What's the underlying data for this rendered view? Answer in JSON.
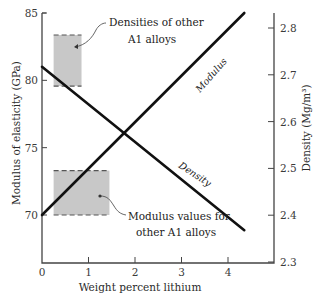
{
  "chart_data": {
    "type": "line",
    "title": "",
    "xlabel": "Weight percent lithium",
    "ylabel_left": "Modulus of elasticity (GPa)",
    "ylabel_right": "Density (Mg/m³)",
    "xlim": [
      0,
      5
    ],
    "ylim_left": [
      67.5,
      85
    ],
    "ylim_right": [
      2.3,
      2.83
    ],
    "x_ticks": [
      0,
      1,
      2,
      3,
      4
    ],
    "x_tick_labels": [
      "0",
      "1",
      "2",
      "3",
      "4"
    ],
    "y_left_ticks": [
      70,
      75,
      80,
      85
    ],
    "y_left_tick_labels": [
      "70",
      "75",
      "80",
      "85"
    ],
    "y_right_ticks": [
      2.3,
      2.4,
      2.5,
      2.6,
      2.7,
      2.8
    ],
    "y_right_tick_labels": [
      "2.3",
      "2.4",
      "2.5",
      "2.6",
      "2.7",
      "2.8"
    ],
    "grid": false,
    "series": [
      {
        "name": "Modulus",
        "axis": "left",
        "x": [
          0,
          4.35
        ],
        "y": [
          70,
          85
        ]
      },
      {
        "name": "Density",
        "axis": "right",
        "x": [
          0,
          4.35
        ],
        "y": [
          2.717,
          2.368
        ]
      }
    ],
    "shaded_regions": [
      {
        "label": "Densities of other Al alloys",
        "label_lines": [
          "Densities of other",
          "A1 alloys"
        ],
        "axis": "right",
        "x_range": [
          0.25,
          0.85
        ],
        "y_range": [
          2.676,
          2.785
        ]
      },
      {
        "label": "Modulus values for other Al alloys",
        "label_lines": [
          "Modulus values for",
          "other A1 alloys"
        ],
        "axis": "left",
        "x_range": [
          0.25,
          1.45
        ],
        "y_range": [
          70,
          73.3
        ]
      }
    ]
  }
}
